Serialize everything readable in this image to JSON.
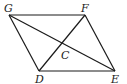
{
  "figure": {
    "labels": {
      "G": "G",
      "F": "F",
      "E": "E",
      "D": "D",
      "C": "C"
    },
    "segments": [
      "GF",
      "FE",
      "ED",
      "DG",
      "GE",
      "DF"
    ]
  }
}
